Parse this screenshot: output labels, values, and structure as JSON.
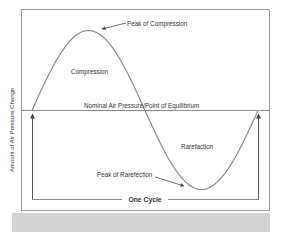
{
  "diagram": {
    "y_axis_label": "Amount of Air Pressure Change",
    "x_axis_label": "Time",
    "equilibrium_label": "Nominal Air Pressure/Point of Equilibrium",
    "peak_compression_label": "Peak of Compression",
    "compression_label": "Compression",
    "rarefaction_label": "Rarefaction",
    "peak_rarefaction_label": "Peak of Rarefection",
    "cycle_label": "One Cycle",
    "colors": {
      "frame": "#9a9a9a",
      "curve": "#8a8a8a",
      "text": "#333333",
      "band": "#d2d2d2"
    }
  },
  "chart_data": {
    "type": "line",
    "title": "",
    "xlabel": "Time",
    "ylabel": "Amount of Air Pressure Change",
    "x": [
      0,
      0.25,
      0.5,
      0.75,
      1.0
    ],
    "series": [
      {
        "name": "Air pressure",
        "values": [
          0,
          1,
          0,
          -1,
          0
        ]
      }
    ],
    "ylim": [
      -1.2,
      1.25
    ],
    "annotations": [
      {
        "text": "Peak of Compression",
        "x": 0.25,
        "y": 1
      },
      {
        "text": "Compression",
        "x": 0.27,
        "y": 0.45
      },
      {
        "text": "Nominal Air Pressure/Point of Equilibrium",
        "x": 0.5,
        "y": 0
      },
      {
        "text": "Rarefaction",
        "x": 0.75,
        "y": -0.4
      },
      {
        "text": "Peak of Rarefection",
        "x": 0.75,
        "y": -1
      },
      {
        "text": "One Cycle",
        "x": 0.5,
        "y": -1.12
      }
    ],
    "grid": false,
    "legend": "none"
  }
}
